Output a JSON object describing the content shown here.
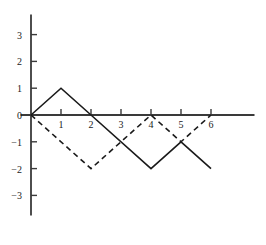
{
  "chart_data": {
    "type": "line",
    "title": "",
    "xlabel": "",
    "ylabel": "",
    "xlim": [
      -0.35,
      7.45
    ],
    "ylim": [
      -3.75,
      3.75
    ],
    "grid": false,
    "legend": "none",
    "xticks": [
      1,
      2,
      3,
      4,
      5,
      6
    ],
    "xtick_labels": [
      "1",
      "2",
      "3",
      "4",
      "5",
      "6"
    ],
    "yticks": [
      3,
      2,
      1,
      0,
      -1,
      -2,
      -3
    ],
    "ytick_labels": [
      "3",
      "2",
      "1",
      "0",
      "−1",
      "−2",
      "−3"
    ],
    "series": [
      {
        "name": "solid-curve",
        "style": "solid",
        "color": "#1a1a1a",
        "points": [
          {
            "x": 0,
            "y": 0
          },
          {
            "x": 1,
            "y": 1
          },
          {
            "x": 2,
            "y": 0
          },
          {
            "x": 4,
            "y": -2
          },
          {
            "x": 5,
            "y": -1
          },
          {
            "x": 6,
            "y": -2
          }
        ]
      },
      {
        "name": "dashed-curve",
        "style": "dashed",
        "color": "#1a1a1a",
        "points": [
          {
            "x": 0,
            "y": 0
          },
          {
            "x": 2,
            "y": -2
          },
          {
            "x": 4,
            "y": 0
          },
          {
            "x": 5,
            "y": -1
          },
          {
            "x": 6,
            "y": 0
          }
        ]
      }
    ],
    "axes": {
      "x_axis_color": "#3a3a3a",
      "y_axis_color": "#3a3a3a",
      "origin_label": "0"
    }
  }
}
